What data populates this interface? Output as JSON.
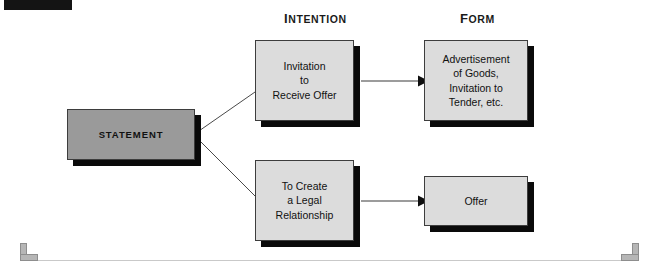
{
  "headings": {
    "intention": {
      "first": "I",
      "rest": "NTENTION"
    },
    "form": {
      "first": "F",
      "rest": "ORM"
    }
  },
  "nodes": {
    "statement": {
      "label": "STATEMENT"
    },
    "invitation_to_receive_offer": {
      "label": "Invitation\nto\nReceive Offer"
    },
    "to_create_a_legal_relationship": {
      "label": "To Create\na Legal\nRelationship"
    },
    "advertisement_of_goods": {
      "label": "Advertisement\nof Goods,\nInvitation to\nTender, etc."
    },
    "offer": {
      "label": "Offer"
    }
  },
  "colors": {
    "statement_fill": "#9a9a9a",
    "node_fill": "#dcdcdc",
    "border": "#3d3d3d",
    "shadow": "#0a0a0a",
    "connector": "#4a4a4a",
    "page_background": "#ffffff",
    "tab": "#141414",
    "corner_bracket": "#b6b6b6"
  },
  "connections": [
    {
      "from": "statement",
      "to": "invitation_to_receive_offer",
      "style": "plain-line"
    },
    {
      "from": "statement",
      "to": "to_create_a_legal_relationship",
      "style": "plain-line"
    },
    {
      "from": "invitation_to_receive_offer",
      "to": "advertisement_of_goods",
      "style": "arrow"
    },
    {
      "from": "to_create_a_legal_relationship",
      "to": "offer",
      "style": "arrow"
    }
  ]
}
